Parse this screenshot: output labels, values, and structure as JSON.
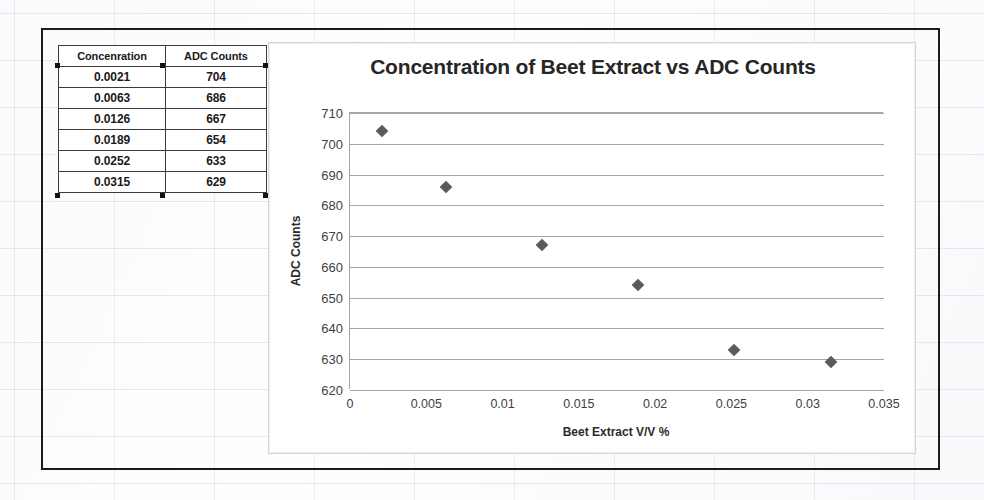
{
  "table": {
    "name": "concentration-vs-adc-table",
    "headers": [
      "Concenration",
      "ADC Counts"
    ],
    "rows": [
      [
        "0.0021",
        "704"
      ],
      [
        "0.0063",
        "686"
      ],
      [
        "0.0126",
        "667"
      ],
      [
        "0.0189",
        "654"
      ],
      [
        "0.0252",
        "633"
      ],
      [
        "0.0315",
        "629"
      ]
    ]
  },
  "chart_data": {
    "type": "scatter",
    "title": "Concentration of Beet Extract vs ADC Counts",
    "xlabel": "Beet Extract V/V %",
    "ylabel": "ADC Counts",
    "xlim": [
      0,
      0.035
    ],
    "ylim": [
      620,
      710
    ],
    "xticks": [
      0,
      0.005,
      0.01,
      0.015,
      0.02,
      0.025,
      0.03,
      0.035
    ],
    "xtick_labels": [
      "0",
      "0.005",
      "0.01",
      "0.015",
      "0.02",
      "0.025",
      "0.03",
      "0.035"
    ],
    "yticks": [
      620,
      630,
      640,
      650,
      660,
      670,
      680,
      690,
      700,
      710
    ],
    "ytick_labels": [
      "620",
      "630",
      "640",
      "650",
      "660",
      "670",
      "680",
      "690",
      "700",
      "710"
    ],
    "grid": "horizontal",
    "legend": "none",
    "marker": "diamond",
    "marker_color": "#5b5b5b",
    "gridline_color": "#a6a6a6",
    "x": [
      0.0021,
      0.0063,
      0.0126,
      0.0189,
      0.0252,
      0.0315
    ],
    "y": [
      704,
      686,
      667,
      654,
      633,
      629
    ],
    "series": [
      {
        "name": "ADC Counts",
        "points": [
          {
            "x": 0.0021,
            "y": 704
          },
          {
            "x": 0.0063,
            "y": 686
          },
          {
            "x": 0.0126,
            "y": 667
          },
          {
            "x": 0.0189,
            "y": 654
          },
          {
            "x": 0.0252,
            "y": 633
          },
          {
            "x": 0.0315,
            "y": 629
          }
        ]
      }
    ]
  }
}
